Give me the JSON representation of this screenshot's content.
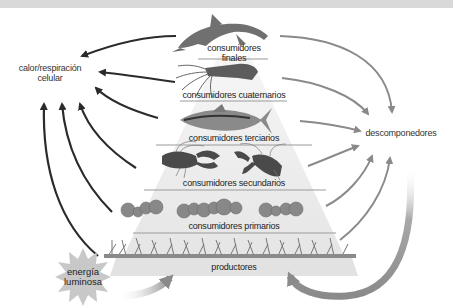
{
  "levels": [
    {
      "id": "finales",
      "label": "consumidores finales",
      "line1": "consumidores",
      "line2": "finales",
      "organism": "dolphin-icon"
    },
    {
      "id": "cuaternarios",
      "label": "consumidores cuaternarios",
      "organism": "squid-icon"
    },
    {
      "id": "terciarios",
      "label": "consumidores terciarios",
      "organism": "tuna-icon"
    },
    {
      "id": "secundarios",
      "label": "consumidores secundarios",
      "organism": "lobster-icon"
    },
    {
      "id": "primarios",
      "label": "consumidores primarios",
      "organism": "zooplankton-icon"
    },
    {
      "id": "productores",
      "label": "productores",
      "organism": "algae-icon"
    }
  ],
  "heat": {
    "line1": "calor/respiración",
    "line2": "celular"
  },
  "decomposers": {
    "label": "descomponedores"
  },
  "energy": {
    "line1": "energía",
    "line2": "luminosa"
  },
  "colors": {
    "heat_arrow": "#2b2b2b",
    "decomposer_arrow": "#8a8a8a",
    "pyramid_fill": "#ececec",
    "pyramid_line": "#9a9a9a",
    "sun_fill": "#c8c8c8",
    "organism": "#6e6e6e",
    "topbar": "#d9d9d9"
  }
}
